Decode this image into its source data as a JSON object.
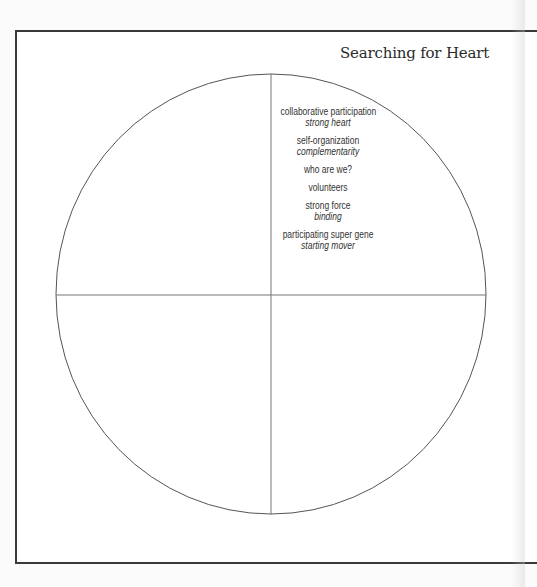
{
  "title": "Searching for Heart",
  "diagram": {
    "type": "quadrant-circle",
    "colors": {
      "frame": "#3a3a3a",
      "circle": "#555555",
      "axes": "#777777",
      "text": "#333333"
    },
    "quadrants": {
      "top_right": {
        "items": [
          {
            "main": "collaborative participation",
            "sub": "strong heart"
          },
          {
            "main": "self-organization",
            "sub": "complementarity"
          },
          {
            "main": "who are we?",
            "sub": ""
          },
          {
            "main": "volunteers",
            "sub": ""
          },
          {
            "main": "strong force",
            "sub": "binding"
          },
          {
            "main": "participating super gene",
            "sub": "starting mover"
          }
        ]
      },
      "top_left": {
        "items": []
      },
      "bottom_left": {
        "items": []
      },
      "bottom_right": {
        "items": []
      }
    }
  }
}
